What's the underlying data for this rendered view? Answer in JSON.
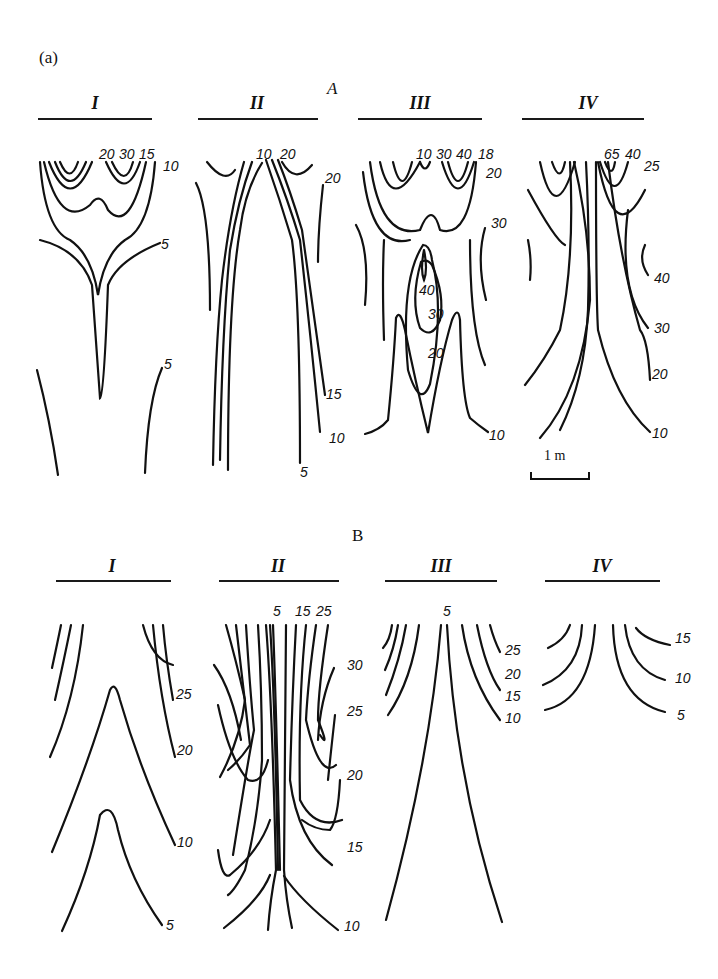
{
  "figure": {
    "panel_label": "(a)",
    "scale_label": "1 m",
    "section_a": {
      "label": "A",
      "columns": [
        {
          "numeral": "I",
          "labels": [
            "20",
            "30",
            "15",
            "10",
            "5",
            "5"
          ]
        },
        {
          "numeral": "II",
          "labels": [
            "10",
            "20",
            "20",
            "15",
            "10",
            "5"
          ]
        },
        {
          "numeral": "III",
          "labels": [
            "10",
            "30",
            "40",
            "18",
            "20",
            "30",
            "40",
            "30",
            "20",
            "10"
          ]
        },
        {
          "numeral": "IV",
          "labels": [
            "65",
            "40",
            "25",
            "40",
            "30",
            "20",
            "10"
          ]
        }
      ]
    },
    "section_b": {
      "label": "B",
      "columns": [
        {
          "numeral": "I",
          "labels": [
            "25",
            "20",
            "10",
            "5"
          ]
        },
        {
          "numeral": "II",
          "labels": [
            "5",
            "15",
            "25",
            "30",
            "25",
            "20",
            "15",
            "10"
          ]
        },
        {
          "numeral": "III",
          "labels": [
            "5",
            "25",
            "20",
            "15",
            "10"
          ]
        },
        {
          "numeral": "IV",
          "labels": [
            "15",
            "10",
            "5"
          ]
        }
      ]
    }
  }
}
